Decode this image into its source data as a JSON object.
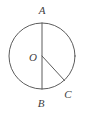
{
  "figure": {
    "kind": "circle-geometry-diagram",
    "canvas": {
      "width": 85,
      "height": 115,
      "background": "#ffffff"
    },
    "stroke_color": "#4a4a4a",
    "stroke_width": 0.9,
    "circle": {
      "name": "main-circle",
      "center_x": 42,
      "center_y": 56,
      "radius": 33
    },
    "points": [
      {
        "id": "A",
        "label": "A",
        "x": 42,
        "y": 23,
        "label_x": 42,
        "label_y": 14,
        "role": "top-of-circle"
      },
      {
        "id": "O",
        "label": "O",
        "x": 42,
        "y": 56,
        "label_x": 33,
        "label_y": 61,
        "role": "center"
      },
      {
        "id": "B",
        "label": "B",
        "x": 42,
        "y": 89,
        "label_x": 41,
        "label_y": 107,
        "role": "bottom-of-circle"
      },
      {
        "id": "C",
        "label": "C",
        "x": 64.5,
        "y": 80.5,
        "label_x": 68,
        "label_y": 98,
        "role": "on-circle-lower-right"
      }
    ],
    "segments": [
      {
        "id": "AB",
        "name": "diameter-ab",
        "from": "A",
        "to": "B",
        "x1": 42,
        "y1": 23,
        "x2": 42,
        "y2": 89
      },
      {
        "id": "OC",
        "name": "radius-oc",
        "from": "O",
        "to": "C",
        "x1": 42,
        "y1": 56,
        "x2": 64.5,
        "y2": 80.5
      }
    ]
  }
}
